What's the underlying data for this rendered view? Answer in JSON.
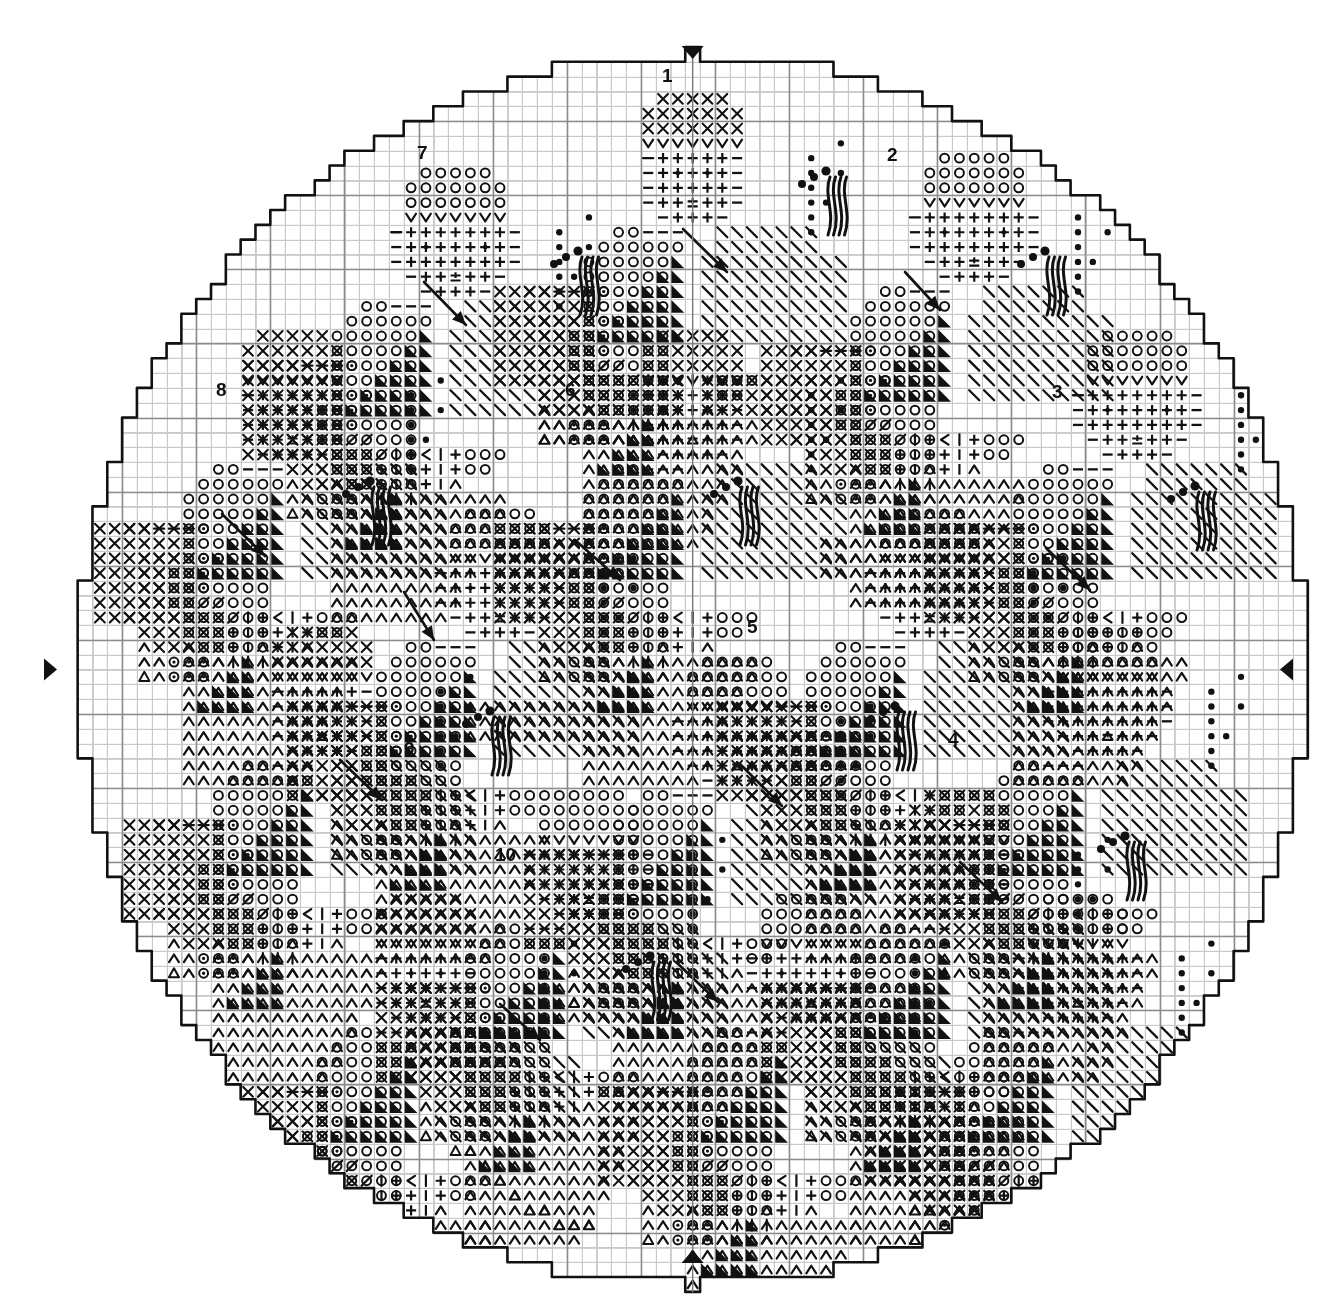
{
  "document": {
    "type": "needlework-chart",
    "subtype": "cross-stitch-round-doily-chart",
    "title": "",
    "background_color": "#ffffff",
    "ink_color": "#111111"
  },
  "grid": {
    "cell_size_px": 14.82,
    "origin_x_px": 48,
    "origin_y_px": 47,
    "columns": 87,
    "rows": 84,
    "minor_line_color": "#c9c9c9",
    "minor_line_width_px": 1,
    "major_line_color": "#8c8c8c",
    "major_line_width_px": 1.6,
    "major_every": 5,
    "show_grid": true
  },
  "shape": {
    "outline_color": "#111111",
    "outline_width_px": 2.6,
    "description": "stepped circular (round doily) boundary following grid cells",
    "center_col": 43.5,
    "center_row": 42.0,
    "radius_cells": 41.5
  },
  "center_markers": [
    {
      "name": "top-center-marker",
      "glyph": "down-triangle",
      "col": 43.5,
      "row": 0,
      "position": "top",
      "color": "#111111"
    },
    {
      "name": "bottom-center-marker",
      "glyph": "up-triangle",
      "col": 43.5,
      "row": 84,
      "position": "bottom",
      "color": "#111111"
    },
    {
      "name": "left-center-marker",
      "glyph": "right-triangle",
      "col": 0,
      "row": 42.0,
      "position": "left",
      "color": "#111111"
    },
    {
      "name": "right-center-marker",
      "glyph": "left-triangle",
      "col": 87,
      "row": 42.0,
      "position": "right",
      "color": "#111111"
    }
  ],
  "motif_numbers": [
    {
      "label": "1",
      "x_px": 668,
      "y_px": 76,
      "name": "motif-number-1"
    },
    {
      "label": "2",
      "x_px": 893,
      "y_px": 155,
      "name": "motif-number-2"
    },
    {
      "label": "3",
      "x_px": 1058,
      "y_px": 392,
      "name": "motif-number-3"
    },
    {
      "label": "4",
      "x_px": 954,
      "y_px": 740,
      "name": "motif-number-4"
    },
    {
      "label": "5",
      "x_px": 753,
      "y_px": 627,
      "name": "motif-number-5"
    },
    {
      "label": "6",
      "x_px": 571,
      "y_px": 390,
      "name": "motif-number-6"
    },
    {
      "label": "7",
      "x_px": 423,
      "y_px": 153,
      "name": "motif-number-7"
    },
    {
      "label": "8",
      "x_px": 222,
      "y_px": 390,
      "name": "motif-number-8"
    },
    {
      "label": "9",
      "x_px": 410,
      "y_px": 749,
      "name": "motif-number-9"
    },
    {
      "label": "10",
      "x_px": 501,
      "y_px": 855,
      "name": "motif-number-10"
    }
  ],
  "symbol_legend": [
    {
      "key": "x",
      "glyph": "X",
      "name": "cross-symbol"
    },
    {
      "key": "o",
      "glyph": "O",
      "name": "open-circle-symbol"
    },
    {
      "key": "dotcirc",
      "glyph": "⊙",
      "name": "dotted-circle-symbol"
    },
    {
      "key": "dot",
      "glyph": "●",
      "name": "filled-dot-symbol"
    },
    {
      "key": "v",
      "glyph": "V",
      "name": "v-down-symbol"
    },
    {
      "key": "caret",
      "glyph": "Λ",
      "name": "v-up-symbol"
    },
    {
      "key": "plus",
      "glyph": "+",
      "name": "plus-symbol"
    },
    {
      "key": "minus",
      "glyph": "–",
      "name": "minus-symbol"
    },
    {
      "key": "pm",
      "glyph": "±",
      "name": "plus-minus-symbol"
    },
    {
      "key": "plusdot",
      "glyph": "+·",
      "name": "plus-dot-symbol"
    },
    {
      "key": "bslash",
      "glyph": "\\",
      "name": "backslash-symbol"
    },
    {
      "key": "fslash",
      "glyph": "/",
      "name": "forwardslash-symbol"
    },
    {
      "key": "bar",
      "glyph": "|",
      "name": "vertical-bar-symbol"
    },
    {
      "key": "lt",
      "glyph": "<",
      "name": "less-than-symbol"
    },
    {
      "key": "tri",
      "glyph": "◢",
      "name": "filled-triangle-symbol"
    },
    {
      "key": "tri_ul",
      "glyph": "◤",
      "name": "filled-triangle-ul-symbol"
    },
    {
      "key": "uptri",
      "glyph": "△",
      "name": "open-triangle-symbol"
    }
  ],
  "motif_parts": {
    "flower_head_rows": [
      "..ooooo..",
      ".ooooooo.",
      ".ooooooo.",
      ".VVVVVVV.",
      "-+++++-",
      "-+*+++*+-",
      "-+++++-",
      "-++pm++-",
      "..-+++-.."
    ],
    "note": "Each repeated motif is a stylised flower/berry sprig with stem needle-strokes, leaf hatching, and filled triangle shading."
  },
  "decor": {
    "stem_strokes_name": "stem-stroke-group",
    "berry_cluster_name": "berry-dot-cluster",
    "leaf_hatch_name": "leaf-hatch-block",
    "arrow_name": "motif-arrow-pointer"
  }
}
